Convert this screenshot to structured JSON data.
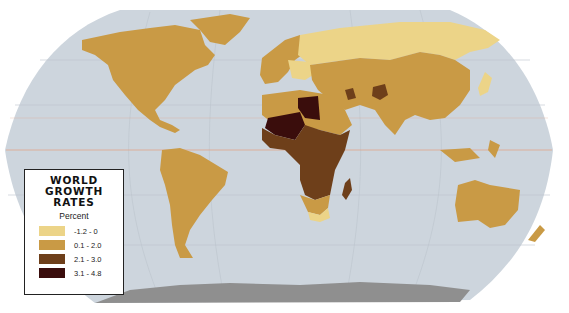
{
  "map": {
    "title": "World Growth Rates",
    "ocean_color": "#cdd5dd",
    "antarctica_color": "#8f8f8f",
    "graticule_color": "#bcc4cc",
    "equator_color": "#e0a58a"
  },
  "legend": {
    "title_line1": "WORLD GROWTH",
    "title_line2": "RATES",
    "subtitle": "Percent",
    "items": [
      {
        "label": "-1.2 - 0",
        "color": "#ecd488"
      },
      {
        "label": "0.1 - 2.0",
        "color": "#c99a45"
      },
      {
        "label": "2.1 - 3.0",
        "color": "#6e3f1a"
      },
      {
        "label": "3.1 - 4.8",
        "color": "#3a0d0c"
      }
    ]
  },
  "regions": [
    {
      "name": "North America",
      "class": "0.1 - 2.0"
    },
    {
      "name": "Greenland",
      "class": "0.1 - 2.0"
    },
    {
      "name": "South America",
      "class": "0.1 - 2.0"
    },
    {
      "name": "Russia",
      "class": "-1.2 - 0"
    },
    {
      "name": "Eastern Europe",
      "class": "-1.2 - 0"
    },
    {
      "name": "Western Europe",
      "class": "0.1 - 2.0"
    },
    {
      "name": "China",
      "class": "0.1 - 2.0"
    },
    {
      "name": "India",
      "class": "0.1 - 2.0"
    },
    {
      "name": "Australia",
      "class": "0.1 - 2.0"
    },
    {
      "name": "Japan",
      "class": "-1.2 - 0"
    },
    {
      "name": "Afghanistan",
      "class": "2.1 - 3.0"
    },
    {
      "name": "Libya",
      "class": "3.1 - 4.8"
    },
    {
      "name": "Sahel",
      "class": "3.1 - 4.8"
    },
    {
      "name": "Central Africa",
      "class": "2.1 - 3.0"
    },
    {
      "name": "Southern Africa",
      "class": "0.1 - 2.0"
    },
    {
      "name": "South Africa",
      "class": "-1.2 - 0"
    },
    {
      "name": "Madagascar",
      "class": "2.1 - 3.0"
    }
  ]
}
